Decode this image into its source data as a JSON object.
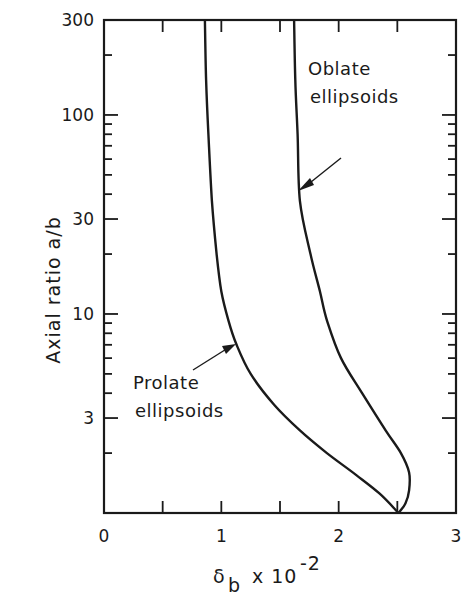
{
  "chart_data": {
    "type": "line",
    "title": "",
    "xlabel": "δb x 10^-2",
    "xlabel_parts": {
      "symbol": "δ",
      "subscript": "b",
      "mult": "x 10",
      "exponent": "-2"
    },
    "ylabel": "Axial ratio  a/b",
    "xlim": [
      0,
      3
    ],
    "ylim": [
      1,
      300
    ],
    "yscale": "log",
    "grid": false,
    "legend": null,
    "x_ticks": [
      0,
      1,
      2,
      3
    ],
    "x_tick_labels": [
      "0",
      "1",
      "2",
      "3"
    ],
    "x_minor_ticks": [
      0.5,
      1.5,
      2.5
    ],
    "y_ticks": [
      3,
      10,
      30,
      100,
      300
    ],
    "y_tick_labels": [
      "3",
      "10",
      "30",
      "100",
      "300"
    ],
    "series": [
      {
        "name": "Prolate ellipsoids",
        "points": [
          [
            0.86,
            300
          ],
          [
            0.87,
            150
          ],
          [
            0.89,
            80
          ],
          [
            0.92,
            37
          ],
          [
            0.96,
            20
          ],
          [
            1.0,
            13
          ],
          [
            1.06,
            9.3
          ],
          [
            1.13,
            7
          ],
          [
            1.25,
            5
          ],
          [
            1.45,
            3.5
          ],
          [
            1.67,
            2.6
          ],
          [
            1.9,
            2.0
          ],
          [
            2.15,
            1.55
          ],
          [
            2.35,
            1.25
          ],
          [
            2.51,
            1.0
          ]
        ]
      },
      {
        "name": "Oblate ellipsoids",
        "points": [
          [
            1.62,
            300
          ],
          [
            1.63,
            150
          ],
          [
            1.65,
            80
          ],
          [
            1.67,
            37
          ],
          [
            1.76,
            20
          ],
          [
            1.84,
            13
          ],
          [
            1.9,
            9.3
          ],
          [
            2.02,
            6
          ],
          [
            2.2,
            4
          ],
          [
            2.4,
            2.6
          ],
          [
            2.53,
            2.0
          ],
          [
            2.6,
            1.6
          ],
          [
            2.6,
            1.3
          ],
          [
            2.57,
            1.12
          ],
          [
            2.51,
            1.0
          ]
        ]
      }
    ],
    "annotations": [
      {
        "text_line1": "Oblate",
        "text_line2": "ellipsoids",
        "arrow_to": [
          1.65,
          45
        ]
      },
      {
        "text_line1": "Prolate",
        "text_line2": "ellipsoids",
        "arrow_to": [
          1.1,
          7.8
        ]
      }
    ]
  },
  "labels": {
    "oblate_1": "Oblate",
    "oblate_2": "ellipsoids",
    "prolate_1": "Prolate",
    "prolate_2": "ellipsoids",
    "ylabel": "Axial ratio  a/b",
    "x_sym": "δ",
    "x_sub": "b",
    "x_mult": "x 10",
    "x_exp": "-2"
  },
  "colors": {
    "ink": "#1a1a1a",
    "background": "#ffffff"
  }
}
